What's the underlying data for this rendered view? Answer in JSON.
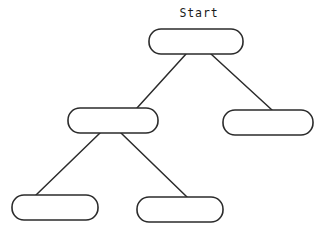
{
  "diagram": {
    "title": "",
    "type": "tree-flowchart",
    "style": {
      "background_color": "#ffffff",
      "stroke_color": "#2b2b2b",
      "fill_color": "#ffffff",
      "text_color": "#1a1a1a",
      "stroke_width": 1.6,
      "corner_radius": 12
    },
    "captions": [
      {
        "id": "start-caption",
        "text": "Start",
        "x": 199,
        "y": 17,
        "anchor": "middle"
      }
    ],
    "nodes": [
      {
        "id": "node-root",
        "name": "root-node",
        "label": "",
        "x": 149,
        "y": 29,
        "width": 94,
        "height": 25,
        "level": 0
      },
      {
        "id": "node-mid-left",
        "name": "mid-left-node",
        "label": "",
        "x": 68,
        "y": 108,
        "width": 90,
        "height": 25,
        "level": 1
      },
      {
        "id": "node-mid-right",
        "name": "mid-right-node",
        "label": "",
        "x": 223,
        "y": 110,
        "width": 90,
        "height": 25,
        "level": 1
      },
      {
        "id": "node-leaf-left",
        "name": "leaf-left-node",
        "label": "",
        "x": 12,
        "y": 195,
        "width": 86,
        "height": 25,
        "level": 2
      },
      {
        "id": "node-leaf-middle",
        "name": "leaf-middle-node",
        "label": "",
        "x": 137,
        "y": 197,
        "width": 86,
        "height": 25,
        "level": 2
      }
    ],
    "edges": [
      {
        "id": "edge-root-midleft",
        "name": "edge-root-to-mid-left",
        "from": "node-root",
        "to": "node-mid-left",
        "x1": 186,
        "y1": 54,
        "x2": 137,
        "y2": 108
      },
      {
        "id": "edge-root-midright",
        "name": "edge-root-to-mid-right",
        "from": "node-root",
        "to": "node-mid-right",
        "x1": 211,
        "y1": 54,
        "x2": 272,
        "y2": 110
      },
      {
        "id": "edge-midleft-leafleft",
        "name": "edge-mid-left-to-leaf-left",
        "from": "node-mid-left",
        "to": "node-leaf-left",
        "x1": 100,
        "y1": 133,
        "x2": 36,
        "y2": 195
      },
      {
        "id": "edge-midleft-leafmiddle",
        "name": "edge-mid-left-to-leaf-middle",
        "from": "node-mid-left",
        "to": "node-leaf-middle",
        "x1": 121,
        "y1": 133,
        "x2": 187,
        "y2": 197
      }
    ]
  }
}
